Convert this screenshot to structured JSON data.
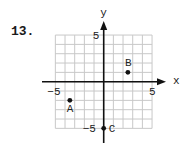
{
  "problem": {
    "number": "13."
  },
  "chart_data": {
    "type": "scatter",
    "title": "",
    "xlabel": "x",
    "ylabel": "y",
    "xlim": [
      -5,
      5
    ],
    "ylim": [
      -5,
      5
    ],
    "grid": true,
    "grid_step": 1,
    "tick_labels": {
      "x": [
        {
          "value": -5,
          "label": "−5"
        },
        {
          "value": 5,
          "label": "5"
        }
      ],
      "y": [
        {
          "value": 5,
          "label": "5"
        },
        {
          "value": -5,
          "label": "−5"
        }
      ]
    },
    "points": [
      {
        "name": "A",
        "x": -3.5,
        "y": -2
      },
      {
        "name": "B",
        "x": 2.5,
        "y": 1
      },
      {
        "name": "C",
        "x": 0,
        "y": -5
      }
    ],
    "colors": {
      "grid": "#c8c8c8",
      "axis": "#111111",
      "point": "#111111"
    }
  }
}
